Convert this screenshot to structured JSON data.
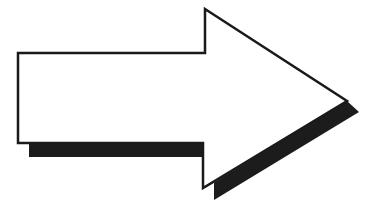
{
  "diagram": {
    "shape": "right-arrow",
    "direction": "right",
    "colors": {
      "background": "#ffffff",
      "fill": "#ffffff",
      "stroke": "#1a1a1a",
      "shadow": "#1c1c1c"
    }
  }
}
